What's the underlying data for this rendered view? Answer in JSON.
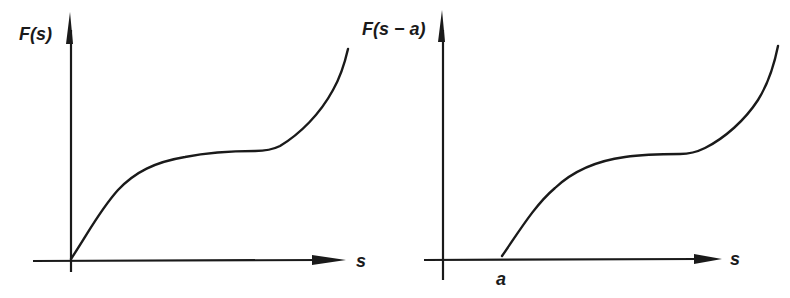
{
  "figure": {
    "left_panel": {
      "y_label": "F(s)",
      "x_label": "s",
      "description": "Original function F(s) starting at origin"
    },
    "right_panel": {
      "y_label": "F(s − a)",
      "x_label": "s",
      "shift_label": "a",
      "description": "Shifted function F(s - a) starting at s = a"
    },
    "colors": {
      "stroke": "#1a1a1a",
      "background": "#ffffff"
    }
  }
}
